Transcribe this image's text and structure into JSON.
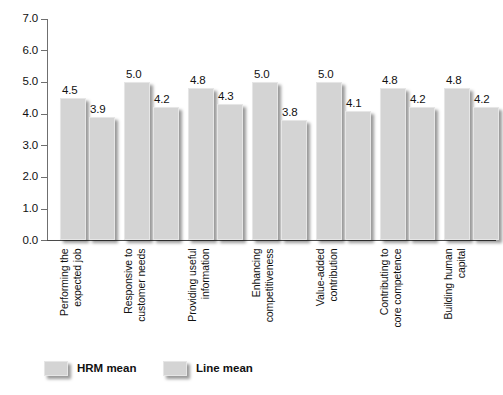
{
  "chart_data": {
    "type": "bar",
    "title": "",
    "xlabel": "",
    "ylabel": "",
    "ylim": [
      0.0,
      7.0
    ],
    "ytick_labels": [
      "7.0",
      "6.0",
      "5.0",
      "4.0",
      "3.0",
      "2.0",
      "1.0",
      "0.0"
    ],
    "ytick_values": [
      7.0,
      6.0,
      5.0,
      4.0,
      3.0,
      2.0,
      1.0,
      0.0
    ],
    "grid": false,
    "legend_position": "bottom-left",
    "categories": [
      "Performing the expected job",
      "Responsive to customer needs",
      "Providing useful information",
      "Enhancing competitiveness",
      "Value-added contribution",
      "Contributing to core competence",
      "Building human capital"
    ],
    "category_lines": [
      [
        "Performing the",
        "expected job"
      ],
      [
        "Responsive to",
        "customer needs"
      ],
      [
        "Providing useful",
        "information"
      ],
      [
        "Enhancing",
        "competitiveness"
      ],
      [
        "Value-added",
        "contribution"
      ],
      [
        "Contributing to",
        "core competence"
      ],
      [
        "Building human",
        "capital"
      ]
    ],
    "series": [
      {
        "name": "HRM mean",
        "color": "#d4d4d4",
        "values": [
          4.5,
          5.0,
          4.8,
          5.0,
          5.0,
          4.8,
          4.8
        ],
        "labels": [
          "4.5",
          "5.0",
          "4.8",
          "5.0",
          "5.0",
          "4.8",
          "4.8"
        ]
      },
      {
        "name": "Line mean",
        "color": "#d4d4d4",
        "values": [
          3.9,
          4.2,
          4.3,
          3.8,
          4.1,
          4.2,
          4.2
        ],
        "labels": [
          "3.9",
          "4.2",
          "4.3",
          "3.8",
          "4.1",
          "4.2",
          "4.2"
        ]
      }
    ]
  },
  "legend": {
    "items": [
      {
        "label": "HRM mean"
      },
      {
        "label": "Line mean"
      }
    ]
  }
}
